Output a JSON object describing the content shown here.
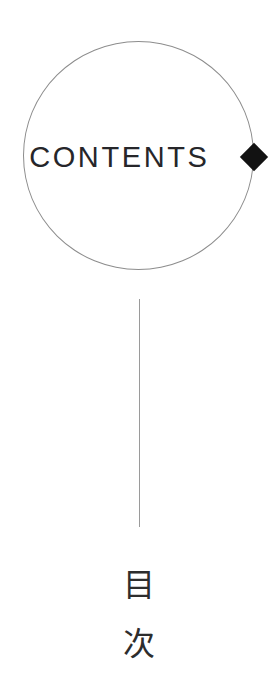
{
  "page": {
    "background_color": "#ffffff",
    "width": 278,
    "height": 676
  },
  "contents_mark": {
    "label": "CONTENTS",
    "text_color": "#26262a",
    "circle_stroke_color": "#8d8d8d",
    "diamond_color": "#121212",
    "diamond_icon_name": "diamond-bullet-icon"
  },
  "divider": {
    "color": "#9a9a9a"
  },
  "japanese_title": {
    "characters": [
      "目",
      "次"
    ],
    "reading": "目次",
    "text_color": "#2d2d2d"
  }
}
